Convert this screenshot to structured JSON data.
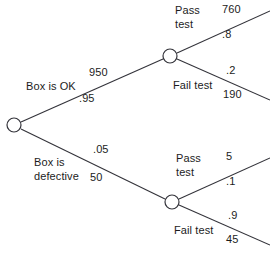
{
  "diagram": {
    "type": "decision-tree",
    "title": "",
    "background_color": "#ffffff",
    "line_color": "#33333a",
    "text_color": "#1c1c1c",
    "nodes": [
      {
        "id": "root",
        "name": "root-chance-node",
        "cx": 14,
        "cy": 125,
        "r": 7
      },
      {
        "id": "ok-node",
        "name": "box-ok-chance-node",
        "cx": 170,
        "cy": 56,
        "r": 7
      },
      {
        "id": "defect-node",
        "name": "box-defective-chance-node",
        "cx": 172,
        "cy": 202,
        "r": 7
      }
    ],
    "branches": [
      {
        "id": "box-ok",
        "name": "branch-box-is-ok",
        "label": "Box is OK",
        "value": "950",
        "probability": ".95",
        "from": "root",
        "to": "ok-node",
        "x1": 21,
        "y1": 122,
        "x2": 163,
        "y2": 59,
        "label_x": 26,
        "label_y": 80,
        "value_x": 89,
        "value_y": 66,
        "prob_x": 79,
        "prob_y": 92
      },
      {
        "id": "box-defective",
        "name": "branch-box-is-defective",
        "label": "Box is defective",
        "label_line1": "Box is",
        "label_line2": "defective",
        "value": "50",
        "probability": ".05",
        "from": "root",
        "to": "defect-node",
        "x1": 21,
        "y1": 129,
        "x2": 165,
        "y2": 199,
        "label_x": 34,
        "label_y": 156,
        "value_x": 90,
        "value_y": 171,
        "prob_x": 93,
        "prob_y": 143
      },
      {
        "id": "ok-pass",
        "name": "branch-ok-pass-test",
        "label": "Pass test",
        "label_line1": "Pass",
        "label_line2": "test",
        "value": "760",
        "probability": ".8",
        "from": "ok-node",
        "to": "leaf-ok-pass",
        "x1": 177,
        "y1": 53,
        "x2": 270,
        "y2": 11,
        "label_x": 175,
        "label_y": 4,
        "value_x": 222,
        "value_y": 3,
        "prob_x": 222,
        "prob_y": 28
      },
      {
        "id": "ok-fail",
        "name": "branch-ok-fail-test",
        "label": "Fail test",
        "value": "190",
        "probability": ".2",
        "from": "ok-node",
        "to": "leaf-ok-fail",
        "x1": 177,
        "y1": 59,
        "x2": 270,
        "y2": 100,
        "label_x": 173,
        "label_y": 79,
        "value_x": 223,
        "value_y": 88,
        "prob_x": 226,
        "prob_y": 64
      },
      {
        "id": "defect-pass",
        "name": "branch-defective-pass-test",
        "label": "Pass test",
        "label_line1": "Pass",
        "label_line2": "test",
        "value": "5",
        "probability": ".1",
        "from": "defect-node",
        "to": "leaf-defect-pass",
        "x1": 179,
        "y1": 199,
        "x2": 270,
        "y2": 158,
        "label_x": 176,
        "label_y": 152,
        "value_x": 226,
        "value_y": 150,
        "prob_x": 226,
        "prob_y": 175
      },
      {
        "id": "defect-fail",
        "name": "branch-defective-fail-test",
        "label": "Fail test",
        "value": "45",
        "probability": ".9",
        "from": "defect-node",
        "to": "leaf-defect-fail",
        "x1": 179,
        "y1": 205,
        "x2": 270,
        "y2": 245,
        "label_x": 174,
        "label_y": 224,
        "value_x": 226,
        "value_y": 233,
        "prob_x": 228,
        "prob_y": 209
      }
    ]
  }
}
